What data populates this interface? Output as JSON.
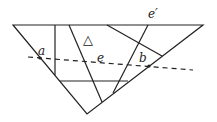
{
  "diagram": {
    "type": "geometric triangulation with dashed cutting line",
    "labels": {
      "a": "a",
      "b": "b",
      "e": "e",
      "e_prime": "e′",
      "triangle": "△"
    },
    "colors": {
      "stroke": "#222222",
      "background": "#ffffff"
    }
  }
}
